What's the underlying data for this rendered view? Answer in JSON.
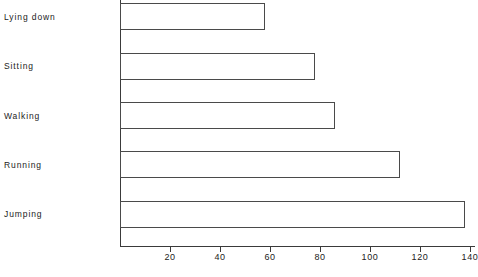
{
  "chart_data": {
    "type": "bar",
    "orientation": "horizontal",
    "title": "",
    "xlabel": "",
    "ylabel": "",
    "categories": [
      "Lying down",
      "Sitting",
      "Walking",
      "Running",
      "Jumping"
    ],
    "values": [
      58,
      78,
      86,
      112,
      138
    ],
    "xlim": [
      0,
      142
    ],
    "xticks": [
      20,
      40,
      60,
      80,
      100,
      120,
      140
    ],
    "xtick_labels": [
      "20",
      "40",
      "60",
      "80",
      "100",
      "120",
      "140"
    ],
    "grid": false,
    "legend": null,
    "bar_fill": "#ffffff",
    "bar_stroke": "#4a4a4a",
    "axis_color": "#3a3a3a",
    "background": "#ffffff"
  }
}
